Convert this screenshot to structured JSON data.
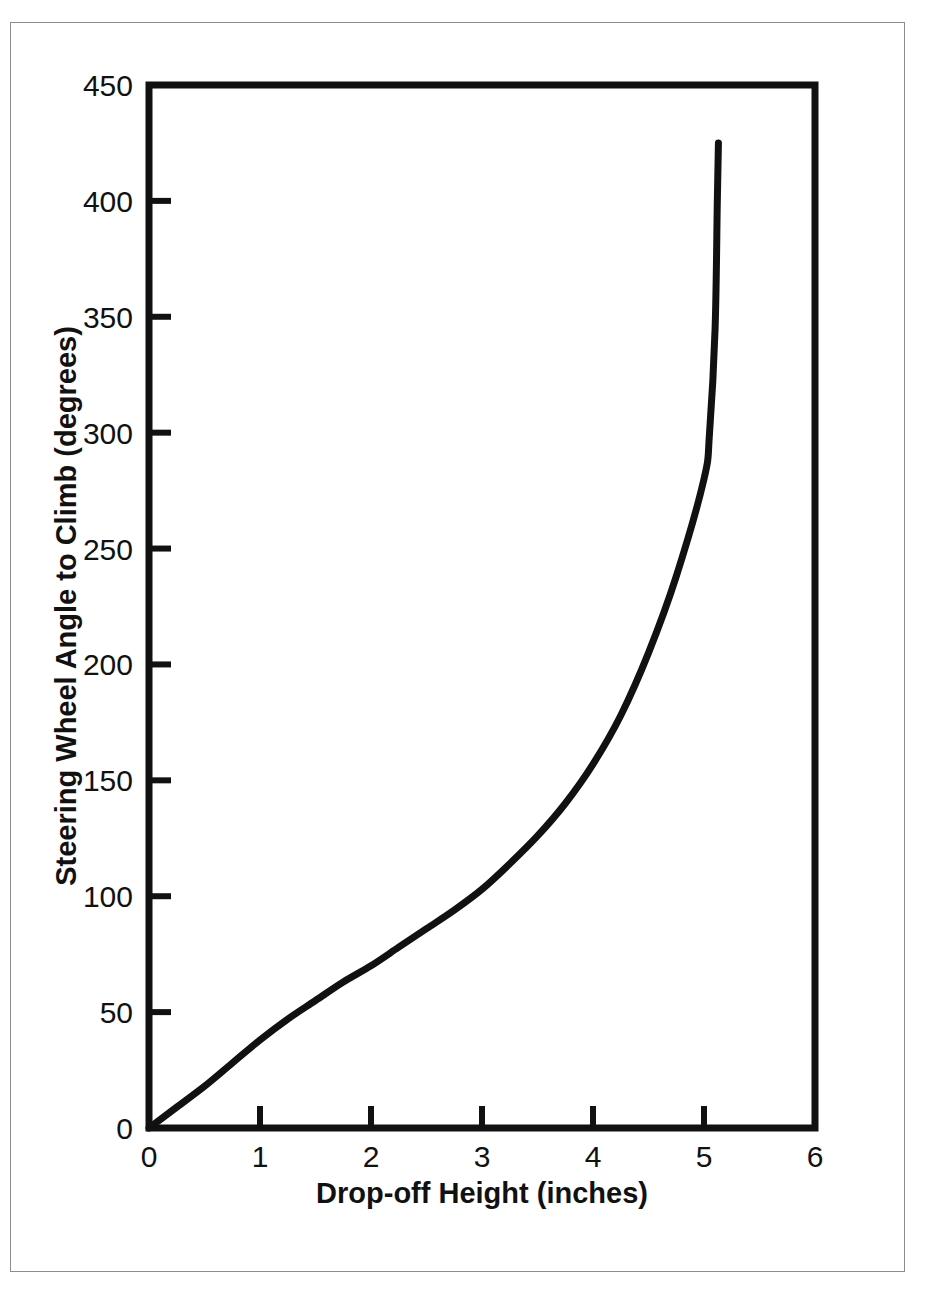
{
  "chart_data": {
    "type": "line",
    "title": "",
    "xlabel": "Drop-off Height (inches)",
    "ylabel": "Steering Wheel Angle to Climb (degrees)",
    "xlim": [
      0,
      6
    ],
    "ylim": [
      0,
      450
    ],
    "xticks": [
      "0",
      "1",
      "2",
      "3",
      "4",
      "5",
      "6"
    ],
    "xtick_values": [
      0,
      1,
      2,
      3,
      4,
      5,
      6
    ],
    "yticks": [
      "0",
      "50",
      "100",
      "150",
      "200",
      "250",
      "300",
      "350",
      "400",
      "450"
    ],
    "ytick_values": [
      0,
      50,
      100,
      150,
      200,
      250,
      300,
      350,
      400,
      450
    ],
    "grid": false,
    "legend": null,
    "series": [
      {
        "name": "Steering wheel angle to climb",
        "x": [
          0.0,
          0.25,
          0.5,
          0.75,
          1.0,
          1.25,
          1.5,
          1.75,
          2.0,
          2.25,
          2.5,
          2.75,
          3.0,
          3.25,
          3.5,
          3.75,
          4.0,
          4.25,
          4.5,
          4.75,
          5.0,
          5.05,
          5.1,
          5.12,
          5.13
        ],
        "values": [
          0,
          9,
          18,
          28,
          38,
          47,
          55,
          63,
          70,
          78,
          86,
          94,
          103,
          114,
          126,
          140,
          157,
          178,
          205,
          238,
          280,
          300,
          345,
          400,
          425
        ]
      }
    ],
    "curve_color": "#111111",
    "axis_color": "#111111",
    "frame_color": "#8c8c8c",
    "background_color": "#ffffff"
  },
  "figure": {
    "width": 928,
    "height": 1295
  }
}
